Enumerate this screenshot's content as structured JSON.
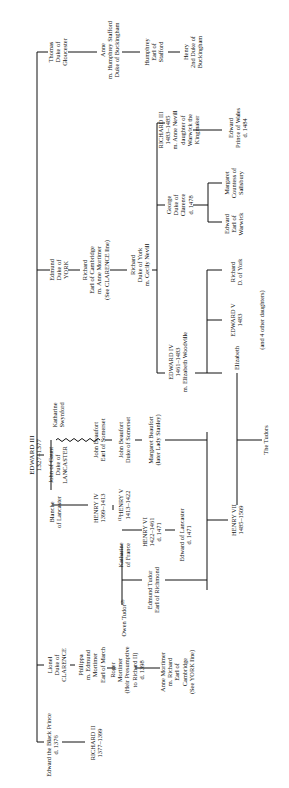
{
  "nodes": {
    "edward3": {
      "l1": "EDWARD III",
      "l2": "1327–1377"
    },
    "thomas": {
      "l1": "Thomas",
      "l2": "Duke of",
      "l3": "Gloucester"
    },
    "anne_stafford": {
      "l1": "Anne",
      "l2": "m. Humphrey Stafford",
      "l3": "Duke of Buckingham"
    },
    "humphrey": {
      "l1": "Humphrey",
      "l2": "Earl of",
      "l3": "Stafford"
    },
    "henry_buck": {
      "l1": "Henry",
      "l2": "2nd Duke of",
      "l3": "Buckingham"
    },
    "edmund_york": {
      "l1": "Edmund",
      "l2": "Duke of",
      "l3": "YORK"
    },
    "richard_cambridge": {
      "l1": "Richard",
      "l2": "Earl of Cambridge",
      "l3": "m. Anne Mortimer",
      "l4": "(See CLARENCE line)"
    },
    "richard_york": {
      "l1": "Richard",
      "l2": "Duke of York",
      "l3": "m. Cecily Nevill"
    },
    "richard3": {
      "l1": "RICHARD III",
      "l2": "1483–1485",
      "l3": "m. Anne Nevill",
      "l4": "daughter of",
      "l5": "Warwick the",
      "l6": "Kingmaker"
    },
    "edward_prince": {
      "l1": "Edward",
      "l2": "Prince of Wales",
      "l3": "d. 1484"
    },
    "george": {
      "l1": "George",
      "l2": "Duke of",
      "l3": "Clarence",
      "l4": "d. 1478"
    },
    "margaret_salisbury": {
      "l1": "Margaret",
      "l2": "Countess of",
      "l3": "Salisbury"
    },
    "edward_warwick": {
      "l1": "Edward",
      "l2": "Earl of",
      "l3": "Warwick"
    },
    "edward4": {
      "l1": "EDWARD IV",
      "l2": "1461–1483",
      "l3": "m. Elizabeth Woodville"
    },
    "richard_dyork": {
      "l1": "Richard",
      "l2": "D. of York"
    },
    "edward5": {
      "l1": "EDWARD V",
      "l2": "1483"
    },
    "other_daughters": {
      "l1": "(and 4 other daughters)"
    },
    "elizabeth": {
      "l1": "Elizabeth"
    },
    "katharine_swynford": {
      "l1": "Katharine",
      "l2": "Swynford"
    },
    "john_gaunt": {
      "l1": "John of Gaunt",
      "l2": "Duke of",
      "l3": "LANCASTER"
    },
    "beaufort_earl": {
      "l1": "John Beaufort",
      "l2": "Earl of Somerset"
    },
    "beaufort_duke": {
      "l1": "John Beaufort",
      "l2": "Duke of Somerset"
    },
    "margaret_beaufort": {
      "l1": "Margaret Beaufort",
      "l2": "(later Lady Stanley)"
    },
    "the_tudors": {
      "l1": "The Tudors"
    },
    "blanche": {
      "l1": "Blanche",
      "l2": "of Lancaster"
    },
    "henry4": {
      "l1": "HENRY IV",
      "l2": "1399–1413"
    },
    "henry5": {
      "l1": "⁽¹⁾HENRY V",
      "l2": "1413–1422"
    },
    "katharine_france": {
      "l1": "Katharine",
      "l2": "of France"
    },
    "owen_tudor": {
      "l1": "Owen Tudor⁽²⁾"
    },
    "henry6": {
      "l1": "HENRY VI",
      "l2": "1422–1461",
      "l3": "d. 1471"
    },
    "edward_lancaster": {
      "l1": "Edward of Lancaster",
      "l2": "d. 1471"
    },
    "edmund_tudor": {
      "l1": "Edmund Tudor",
      "l2": "Earl of Richmond"
    },
    "henry7": {
      "l1": "HENRY VII",
      "l2": "1485–1509"
    },
    "lionel": {
      "l1": "Lionel",
      "l2": "Duke of",
      "l3": "CLARENCE"
    },
    "philippa": {
      "l1": "Philippa",
      "l2": "m. Edmund",
      "l3": "Mortimer",
      "l4": "Earl of March"
    },
    "roger": {
      "l1": "Roger",
      "l2": "Mortimer",
      "l3": "(Heir Presumptive",
      "l4": "to Richard II)",
      "l5": "d. 1398"
    },
    "anne_mortimer": {
      "l1": "Anne Mortimer",
      "l2": "m. Richard",
      "l3": "Earl of",
      "l4": "Cambridge",
      "l5": "(See YORK line)"
    },
    "black_prince": {
      "l1": "Edward the Black Prince",
      "l2": "d. 1376"
    },
    "richard2": {
      "l1": "RICHARD II",
      "l2": "1377–1399"
    }
  }
}
